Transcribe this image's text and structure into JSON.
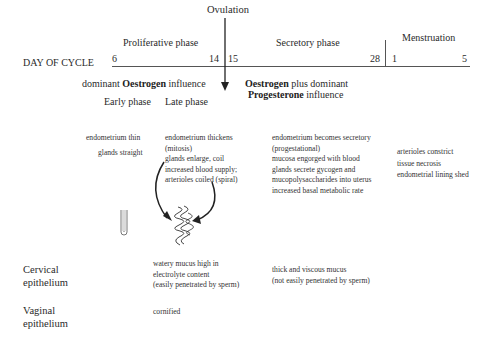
{
  "header": {
    "ovulation": "Ovulation",
    "day_of_cycle": "DAY OF CYCLE",
    "phases": {
      "proliferative": "Proliferative phase",
      "secretory": "Secretory phase",
      "menstruation": "Menstruation"
    },
    "days": {
      "d6": "6",
      "d14": "14",
      "d15": "15",
      "d28": "28",
      "d1": "1",
      "d5": "5"
    }
  },
  "hormones": {
    "proliferative": {
      "pre": "dominant ",
      "bold": "Oestrogen",
      "post": " influence"
    },
    "secretory": {
      "line1_bold": "Oestrogen",
      "line1_post": " plus dominant",
      "line2_bold": "Progesterone",
      "line2_post": " influence"
    }
  },
  "subphases": {
    "early": "Early phase",
    "late": "Late phase"
  },
  "endometrium": {
    "early": [
      "endometrium thin",
      "glands straight"
    ],
    "late": [
      "endometrium thickens",
      "(mitosis)",
      "glands enlarge, coil",
      "increased blood supply;",
      "arterioles coiled (spiral)"
    ],
    "secretory": [
      "endometrium becomes secretory",
      "(progestational)",
      "mucosa engorged with blood",
      "glands secrete gycogen and",
      "mucopolysaccharides into uterus",
      "increased basal metabolic rate"
    ],
    "menstruation": [
      "arterioles constrict",
      "tissue necrosis",
      "endometrial lining shed"
    ]
  },
  "rows": {
    "cervical": {
      "label1": "Cervical",
      "label2": "epithelium",
      "late": [
        "watery mucus high in",
        "electrolyte content",
        "(easily penetrated by sperm)"
      ],
      "secretory": [
        "thick and viscous mucus",
        "(not easily penetrated by sperm)"
      ]
    },
    "vaginal": {
      "label1": "Vaginal",
      "label2": "epithelium",
      "late": "cornified"
    }
  },
  "icons": [
    "straight-gland-icon",
    "coiled-gland-icon",
    "curved-arrow-icon",
    "ovulation-arrow-icon"
  ]
}
